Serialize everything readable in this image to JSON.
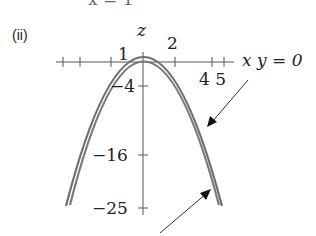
{
  "top_fragment": "x = 1",
  "part_label": "(ii)",
  "axes": {
    "vertical_label": "z",
    "horizontal_label_text": "x  y = 0"
  },
  "tick_labels": {
    "one": "1",
    "two": "2",
    "four_five": "4 5",
    "neg4": "−4",
    "neg16": "−16",
    "neg25": "−25"
  },
  "colors": {
    "curve": "#6e6e6e",
    "axis": "#555555",
    "arrow": "#333333"
  }
}
